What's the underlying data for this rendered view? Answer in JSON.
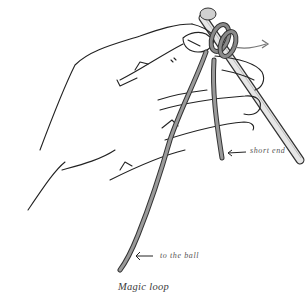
{
  "figure": {
    "caption": "Magic loop",
    "labels": {
      "short_end": "short end",
      "to_the_ball": "to the ball"
    },
    "elements": {
      "hand": "left-hand-outline",
      "needle": "knitting-needle",
      "yarn": "yarn-strands",
      "loop": "magic-loop-wrap",
      "rotation_arrow": "rotation-arrow",
      "pointer_arrows": [
        "arrow-left-short-end",
        "arrow-left-to-ball"
      ]
    },
    "colors": {
      "line": "#222222",
      "yarn": "#8a8a8a",
      "yarn_outline": "#333333",
      "needle": "#d8d8d8",
      "background": "#ffffff"
    }
  }
}
